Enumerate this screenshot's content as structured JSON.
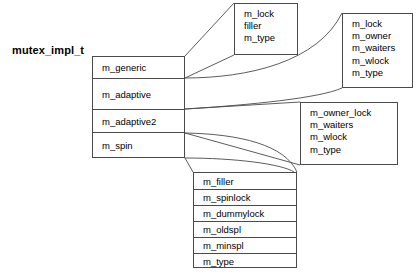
{
  "diagram": {
    "title": "mutex_impl_t",
    "union_box": {
      "name": "mutex-union",
      "members": [
        {
          "label": "m_generic"
        },
        {
          "label": "m_adaptive"
        },
        {
          "label": "m_adaptive2"
        },
        {
          "label": "m_spin"
        }
      ]
    },
    "detail_boxes": [
      {
        "name": "generic-struct",
        "fields": [
          "m_lock",
          "filler",
          "m_type"
        ]
      },
      {
        "name": "adaptive-struct",
        "fields": [
          "m_lock",
          "m_owner",
          "m_waiters",
          "m_wlock",
          "m_type"
        ]
      },
      {
        "name": "adaptive2-struct",
        "fields": [
          "m_owner_lock",
          "m_waiters",
          "m_wlock",
          "m_type"
        ]
      }
    ],
    "spin_table": {
      "name": "spin-struct",
      "fields": [
        "m_filler",
        "m_spinlock",
        "m_dummylock",
        "m_oldspl",
        "m_minspl",
        "m_type"
      ]
    },
    "colors": {
      "stroke": "#4a4a4a",
      "text": "#000000",
      "background": "#ffffff"
    }
  }
}
